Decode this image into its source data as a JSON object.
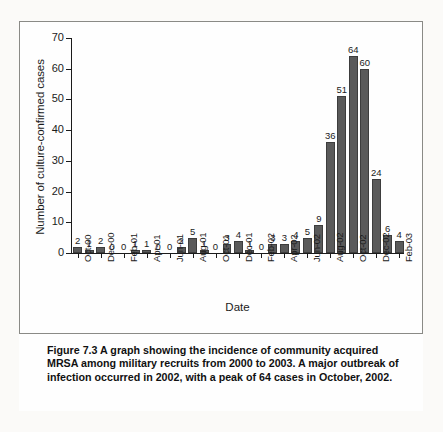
{
  "figure": {
    "number_label": "Figure 7.3",
    "caption_text": " A graph showing the incidence of community acquired MRSA among military recruits from 2000 to 2003. A major outbreak of infection occurred in 2002, with a peak of 64 cases in October, 2002."
  },
  "colors": {
    "bar_fill": "#5a5a5a",
    "bar_stroke": "#3d3d3d",
    "axis": "#1b1b1b",
    "page_background": "#fbfaf8",
    "frame": "#8a8a86"
  },
  "chart_data": {
    "type": "bar",
    "title": "",
    "xlabel": "Date",
    "ylabel": "Number of culture-confirmed cases",
    "ylim": [
      0,
      70
    ],
    "yticks": [
      0,
      10,
      20,
      30,
      40,
      50,
      60,
      70
    ],
    "grid": false,
    "legend": false,
    "categories": [
      "Oct-00",
      "Nov-00",
      "Dec-00",
      "Jan-01",
      "Feb-01",
      "Mar-01",
      "Apr-01",
      "May-01",
      "Jun-01",
      "Jul-01",
      "Aug-01",
      "Sep-01",
      "Oct-01",
      "Nov-01",
      "Dec-01",
      "Jan-02",
      "Feb-02",
      "Mar-02",
      "Apr-02",
      "May-02",
      "Jun-02",
      "Jul-02",
      "Aug-02",
      "Sep-02",
      "Oct-02",
      "Nov-02",
      "Dec-02",
      "Jan-03",
      "Feb-03"
    ],
    "values": [
      2,
      1,
      2,
      0,
      0,
      1,
      1,
      0,
      0,
      2,
      5,
      1,
      0,
      3,
      4,
      1,
      0,
      3,
      3,
      4,
      5,
      9,
      36,
      51,
      64,
      60,
      24,
      6,
      4
    ],
    "tick_labels": [
      "Oct-00",
      "Dec-00",
      "Feb-01",
      "Apr-01",
      "Jun-01",
      "Aug-01",
      "Oct-01",
      "Dec-01",
      "Feb-02",
      "Apr-02",
      "Jun-02",
      "Aug-02",
      "Oct-02",
      "Dec-02",
      "Feb-03"
    ]
  }
}
